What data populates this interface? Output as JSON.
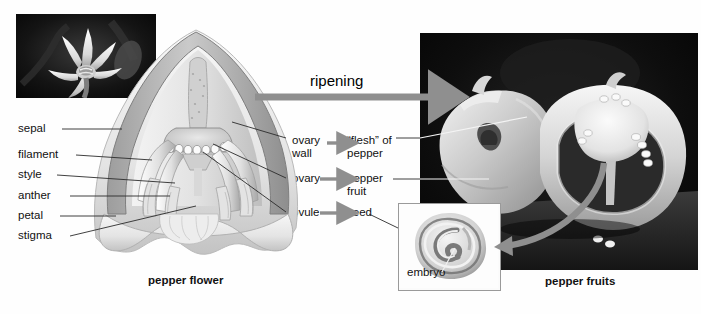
{
  "figure": {
    "title_left": "pepper flower",
    "title_right": "pepper fruits",
    "process_label": "ripening"
  },
  "flower_labels": [
    {
      "key": "sepal",
      "text": "sepal"
    },
    {
      "key": "filament",
      "text": "filament"
    },
    {
      "key": "style",
      "text": "style"
    },
    {
      "key": "anther",
      "text": "anther"
    },
    {
      "key": "petal",
      "text": "petal"
    },
    {
      "key": "stigma",
      "text": "stigma"
    }
  ],
  "transformations": [
    {
      "from_line1": "ovary",
      "from_line2": "wall",
      "to_line1": "“flesh” of",
      "to_line2": "pepper"
    },
    {
      "from_line1": "ovary",
      "from_line2": "",
      "to_line1": "pepper",
      "to_line2": "fruit"
    },
    {
      "from_line1": "ovule",
      "from_line2": "",
      "to_line1": "seed",
      "to_line2": ""
    }
  ],
  "inset": {
    "label": "embryo"
  },
  "photos": {
    "flower_photo_alt": "pepper flower photograph",
    "fruit_photo_alt": "pepper fruits photograph"
  },
  "colors": {
    "arrow_gray": "#8f8f8f",
    "leader_line": "#2b2b2b",
    "inset_border": "#9a9a9a",
    "photo_background": "#000000"
  }
}
